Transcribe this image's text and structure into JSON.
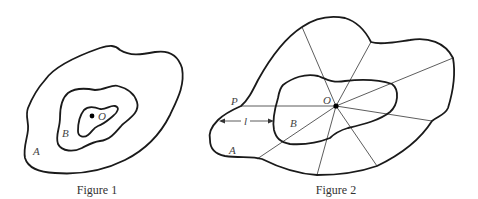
{
  "figure1": {
    "caption": "Figure 1",
    "labels": {
      "outer": "A",
      "middle": "B",
      "center": "O"
    }
  },
  "figure2": {
    "caption": "Figure 2",
    "labels": {
      "outer": "A",
      "inner": "B",
      "center": "O",
      "point": "P",
      "length": "l"
    },
    "ray_count": 8
  },
  "colors": {
    "stroke": "#1a1a1a",
    "background": "#ffffff"
  }
}
